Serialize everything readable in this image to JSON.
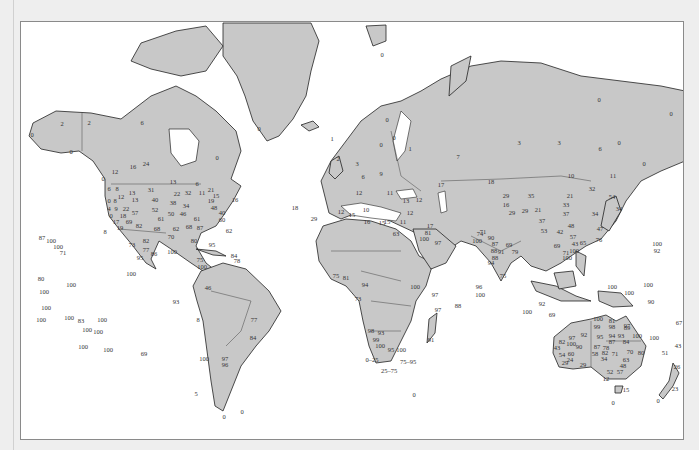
{
  "map": {
    "projection": "Mercator world map",
    "colors": {
      "land": "#c8c8c8",
      "ocean": "#ffffff",
      "outline": "#222222",
      "page": "#eeeeee"
    },
    "labels": [
      {
        "t": "2",
        "x": 61,
        "y": 123
      },
      {
        "t": "2",
        "x": 88,
        "y": 122
      },
      {
        "t": "0",
        "x": 31,
        "y": 134
      },
      {
        "t": "0",
        "x": 70,
        "y": 151
      },
      {
        "t": "6",
        "x": 141,
        "y": 122
      },
      {
        "t": "0",
        "x": 258,
        "y": 128
      },
      {
        "t": "0",
        "x": 216,
        "y": 157
      },
      {
        "t": "16",
        "x": 132,
        "y": 166
      },
      {
        "t": "24",
        "x": 145,
        "y": 163
      },
      {
        "t": "12",
        "x": 114,
        "y": 171
      },
      {
        "t": "0",
        "x": 102,
        "y": 178
      },
      {
        "t": "13",
        "x": 172,
        "y": 181
      },
      {
        "t": "6",
        "x": 196,
        "y": 183
      },
      {
        "t": "31",
        "x": 150,
        "y": 189
      },
      {
        "t": "6",
        "x": 108,
        "y": 188
      },
      {
        "t": "8",
        "x": 116,
        "y": 188
      },
      {
        "t": "12",
        "x": 120,
        "y": 196
      },
      {
        "t": "13",
        "x": 131,
        "y": 192
      },
      {
        "t": "22",
        "x": 176,
        "y": 193
      },
      {
        "t": "32",
        "x": 187,
        "y": 192
      },
      {
        "t": "11",
        "x": 201,
        "y": 192
      },
      {
        "t": "21",
        "x": 210,
        "y": 189
      },
      {
        "t": "0",
        "x": 108,
        "y": 200
      },
      {
        "t": "8",
        "x": 114,
        "y": 200
      },
      {
        "t": "13",
        "x": 134,
        "y": 199
      },
      {
        "t": "40",
        "x": 154,
        "y": 199
      },
      {
        "t": "38",
        "x": 172,
        "y": 202
      },
      {
        "t": "34",
        "x": 185,
        "y": 205
      },
      {
        "t": "19",
        "x": 210,
        "y": 200
      },
      {
        "t": "15",
        "x": 215,
        "y": 195
      },
      {
        "t": "16",
        "x": 234,
        "y": 199
      },
      {
        "t": "4",
        "x": 108,
        "y": 208
      },
      {
        "t": "9",
        "x": 115,
        "y": 208
      },
      {
        "t": "22",
        "x": 125,
        "y": 208
      },
      {
        "t": "52",
        "x": 154,
        "y": 209
      },
      {
        "t": "48",
        "x": 213,
        "y": 207
      },
      {
        "t": "40",
        "x": 221,
        "y": 212
      },
      {
        "t": "0",
        "x": 110,
        "y": 215
      },
      {
        "t": "18",
        "x": 122,
        "y": 215
      },
      {
        "t": "57",
        "x": 134,
        "y": 212
      },
      {
        "t": "50",
        "x": 170,
        "y": 213
      },
      {
        "t": "46",
        "x": 182,
        "y": 213
      },
      {
        "t": "60",
        "x": 221,
        "y": 219
      },
      {
        "t": "61",
        "x": 160,
        "y": 218
      },
      {
        "t": "61",
        "x": 196,
        "y": 218
      },
      {
        "t": "17",
        "x": 115,
        "y": 221
      },
      {
        "t": "69",
        "x": 128,
        "y": 221
      },
      {
        "t": "82",
        "x": 138,
        "y": 225
      },
      {
        "t": "62",
        "x": 175,
        "y": 228
      },
      {
        "t": "68",
        "x": 188,
        "y": 226
      },
      {
        "t": "87",
        "x": 199,
        "y": 227
      },
      {
        "t": "19",
        "x": 119,
        "y": 227
      },
      {
        "t": "8",
        "x": 104,
        "y": 231
      },
      {
        "t": "68",
        "x": 156,
        "y": 228
      },
      {
        "t": "70",
        "x": 170,
        "y": 236
      },
      {
        "t": "62",
        "x": 228,
        "y": 230
      },
      {
        "t": "80",
        "x": 193,
        "y": 240
      },
      {
        "t": "87",
        "x": 41,
        "y": 237
      },
      {
        "t": "100",
        "x": 50,
        "y": 240
      },
      {
        "t": "100",
        "x": 57,
        "y": 246
      },
      {
        "t": "71",
        "x": 62,
        "y": 252
      },
      {
        "t": "73",
        "x": 131,
        "y": 244
      },
      {
        "t": "82",
        "x": 145,
        "y": 240
      },
      {
        "t": "77",
        "x": 145,
        "y": 249
      },
      {
        "t": "86",
        "x": 153,
        "y": 253
      },
      {
        "t": "95",
        "x": 139,
        "y": 257
      },
      {
        "t": "100",
        "x": 171,
        "y": 251
      },
      {
        "t": "95",
        "x": 211,
        "y": 244
      },
      {
        "t": "84",
        "x": 233,
        "y": 255
      },
      {
        "t": "78",
        "x": 236,
        "y": 260
      },
      {
        "t": "75",
        "x": 199,
        "y": 259
      },
      {
        "t": "100",
        "x": 201,
        "y": 266
      },
      {
        "t": "100",
        "x": 130,
        "y": 273
      },
      {
        "t": "80",
        "x": 40,
        "y": 278
      },
      {
        "t": "100",
        "x": 70,
        "y": 284
      },
      {
        "t": "100",
        "x": 43,
        "y": 291
      },
      {
        "t": "46",
        "x": 207,
        "y": 287
      },
      {
        "t": "93",
        "x": 175,
        "y": 301
      },
      {
        "t": "100",
        "x": 45,
        "y": 307
      },
      {
        "t": "100",
        "x": 40,
        "y": 319
      },
      {
        "t": "100",
        "x": 68,
        "y": 317
      },
      {
        "t": "83",
        "x": 80,
        "y": 320
      },
      {
        "t": "100",
        "x": 101,
        "y": 319
      },
      {
        "t": "100",
        "x": 86,
        "y": 329
      },
      {
        "t": "100",
        "x": 97,
        "y": 331
      },
      {
        "t": "100",
        "x": 82,
        "y": 346
      },
      {
        "t": "100",
        "x": 107,
        "y": 349
      },
      {
        "t": "69",
        "x": 143,
        "y": 353
      },
      {
        "t": "8",
        "x": 197,
        "y": 319
      },
      {
        "t": "77",
        "x": 253,
        "y": 319
      },
      {
        "t": "84",
        "x": 252,
        "y": 337
      },
      {
        "t": "100",
        "x": 203,
        "y": 358
      },
      {
        "t": "97",
        "x": 224,
        "y": 358
      },
      {
        "t": "96",
        "x": 224,
        "y": 364
      },
      {
        "t": "5",
        "x": 195,
        "y": 393
      },
      {
        "t": "0",
        "x": 223,
        "y": 416
      },
      {
        "t": "0",
        "x": 241,
        "y": 411
      },
      {
        "t": "18",
        "x": 294,
        "y": 207
      },
      {
        "t": "29",
        "x": 313,
        "y": 218
      },
      {
        "t": "0",
        "x": 381,
        "y": 54
      },
      {
        "t": "0",
        "x": 386,
        "y": 119
      },
      {
        "t": "0",
        "x": 380,
        "y": 144
      },
      {
        "t": "0",
        "x": 393,
        "y": 137
      },
      {
        "t": "1",
        "x": 331,
        "y": 138
      },
      {
        "t": "2",
        "x": 337,
        "y": 158
      },
      {
        "t": "3",
        "x": 356,
        "y": 163
      },
      {
        "t": "6",
        "x": 362,
        "y": 176
      },
      {
        "t": "9",
        "x": 380,
        "y": 173
      },
      {
        "t": "1",
        "x": 409,
        "y": 148
      },
      {
        "t": "7",
        "x": 457,
        "y": 156
      },
      {
        "t": "3",
        "x": 518,
        "y": 142
      },
      {
        "t": "3",
        "x": 558,
        "y": 142
      },
      {
        "t": "6",
        "x": 599,
        "y": 148
      },
      {
        "t": "0",
        "x": 618,
        "y": 142
      },
      {
        "t": "0",
        "x": 598,
        "y": 99
      },
      {
        "t": "0",
        "x": 670,
        "y": 113
      },
      {
        "t": "0",
        "x": 643,
        "y": 163
      },
      {
        "t": "12",
        "x": 358,
        "y": 192
      },
      {
        "t": "11",
        "x": 389,
        "y": 192
      },
      {
        "t": "13",
        "x": 405,
        "y": 200
      },
      {
        "t": "17",
        "x": 440,
        "y": 184
      },
      {
        "t": "18",
        "x": 490,
        "y": 181
      },
      {
        "t": "10",
        "x": 570,
        "y": 175
      },
      {
        "t": "11",
        "x": 612,
        "y": 175
      },
      {
        "t": "12",
        "x": 340,
        "y": 211
      },
      {
        "t": "15",
        "x": 351,
        "y": 214
      },
      {
        "t": "10",
        "x": 365,
        "y": 209
      },
      {
        "t": "12",
        "x": 409,
        "y": 212
      },
      {
        "t": "12",
        "x": 418,
        "y": 199
      },
      {
        "t": "16",
        "x": 366,
        "y": 221
      },
      {
        "t": "15",
        "x": 386,
        "y": 221
      },
      {
        "t": "15",
        "x": 381,
        "y": 222
      },
      {
        "t": "11",
        "x": 402,
        "y": 221
      },
      {
        "t": "17",
        "x": 429,
        "y": 225
      },
      {
        "t": "63",
        "x": 395,
        "y": 233
      },
      {
        "t": "81",
        "x": 427,
        "y": 232
      },
      {
        "t": "100",
        "x": 423,
        "y": 238
      },
      {
        "t": "97",
        "x": 437,
        "y": 242
      },
      {
        "t": "29",
        "x": 505,
        "y": 195
      },
      {
        "t": "35",
        "x": 530,
        "y": 195
      },
      {
        "t": "21",
        "x": 569,
        "y": 195
      },
      {
        "t": "32",
        "x": 591,
        "y": 188
      },
      {
        "t": "16",
        "x": 505,
        "y": 204
      },
      {
        "t": "29",
        "x": 511,
        "y": 212
      },
      {
        "t": "29",
        "x": 524,
        "y": 210
      },
      {
        "t": "21",
        "x": 537,
        "y": 209
      },
      {
        "t": "33",
        "x": 565,
        "y": 204
      },
      {
        "t": "37",
        "x": 565,
        "y": 213
      },
      {
        "t": "34",
        "x": 594,
        "y": 213
      },
      {
        "t": "34",
        "x": 618,
        "y": 208
      },
      {
        "t": "54",
        "x": 611,
        "y": 196
      },
      {
        "t": "37",
        "x": 541,
        "y": 220
      },
      {
        "t": "53",
        "x": 543,
        "y": 230
      },
      {
        "t": "42",
        "x": 559,
        "y": 231
      },
      {
        "t": "48",
        "x": 570,
        "y": 225
      },
      {
        "t": "47",
        "x": 599,
        "y": 228
      },
      {
        "t": "76",
        "x": 598,
        "y": 239
      },
      {
        "t": "65",
        "x": 582,
        "y": 242
      },
      {
        "t": "57",
        "x": 572,
        "y": 236
      },
      {
        "t": "43",
        "x": 574,
        "y": 243
      },
      {
        "t": "69",
        "x": 556,
        "y": 245
      },
      {
        "t": "71",
        "x": 482,
        "y": 231
      },
      {
        "t": "74",
        "x": 479,
        "y": 233
      },
      {
        "t": "100",
        "x": 476,
        "y": 240
      },
      {
        "t": "90",
        "x": 490,
        "y": 237
      },
      {
        "t": "87",
        "x": 494,
        "y": 243
      },
      {
        "t": "69",
        "x": 508,
        "y": 244
      },
      {
        "t": "88",
        "x": 493,
        "y": 250
      },
      {
        "t": "91",
        "x": 500,
        "y": 251
      },
      {
        "t": "88",
        "x": 494,
        "y": 257
      },
      {
        "t": "79",
        "x": 514,
        "y": 251
      },
      {
        "t": "94",
        "x": 490,
        "y": 262
      },
      {
        "t": "71",
        "x": 565,
        "y": 252
      },
      {
        "t": "100",
        "x": 573,
        "y": 250
      },
      {
        "t": "100",
        "x": 566,
        "y": 257
      },
      {
        "t": "75",
        "x": 502,
        "y": 275
      },
      {
        "t": "100",
        "x": 656,
        "y": 243
      },
      {
        "t": "92",
        "x": 656,
        "y": 250
      },
      {
        "t": "100",
        "x": 647,
        "y": 284
      },
      {
        "t": "100",
        "x": 611,
        "y": 286
      },
      {
        "t": "90",
        "x": 650,
        "y": 301
      },
      {
        "t": "100",
        "x": 628,
        "y": 292
      },
      {
        "t": "67",
        "x": 678,
        "y": 322
      },
      {
        "t": "100",
        "x": 653,
        "y": 337
      },
      {
        "t": "100",
        "x": 597,
        "y": 318
      },
      {
        "t": "92",
        "x": 541,
        "y": 303
      },
      {
        "t": "100",
        "x": 526,
        "y": 311
      },
      {
        "t": "69",
        "x": 551,
        "y": 314
      },
      {
        "t": "96",
        "x": 478,
        "y": 286
      },
      {
        "t": "100",
        "x": 479,
        "y": 294
      },
      {
        "t": "88",
        "x": 457,
        "y": 305
      },
      {
        "t": "97",
        "x": 437,
        "y": 309
      },
      {
        "t": "91",
        "x": 430,
        "y": 339
      },
      {
        "t": "75",
        "x": 335,
        "y": 275
      },
      {
        "t": "81",
        "x": 345,
        "y": 277
      },
      {
        "t": "73",
        "x": 357,
        "y": 298
      },
      {
        "t": "94",
        "x": 364,
        "y": 284
      },
      {
        "t": "100",
        "x": 414,
        "y": 286
      },
      {
        "t": "97",
        "x": 434,
        "y": 294
      },
      {
        "t": "98",
        "x": 370,
        "y": 330
      },
      {
        "t": "93",
        "x": 380,
        "y": 332
      },
      {
        "t": "99",
        "x": 375,
        "y": 339
      },
      {
        "t": "100",
        "x": 379,
        "y": 345
      },
      {
        "t": "95",
        "x": 390,
        "y": 349
      },
      {
        "t": "100",
        "x": 400,
        "y": 349
      },
      {
        "t": "0–25",
        "x": 371,
        "y": 359
      },
      {
        "t": "75–95",
        "x": 407,
        "y": 361
      },
      {
        "t": "25–75",
        "x": 388,
        "y": 370
      },
      {
        "t": "0",
        "x": 413,
        "y": 394
      },
      {
        "t": "81",
        "x": 611,
        "y": 320
      },
      {
        "t": "99",
        "x": 596,
        "y": 326
      },
      {
        "t": "98",
        "x": 611,
        "y": 326
      },
      {
        "t": "89",
        "x": 626,
        "y": 327
      },
      {
        "t": "97",
        "x": 626,
        "y": 325
      },
      {
        "t": "92",
        "x": 583,
        "y": 334
      },
      {
        "t": "97",
        "x": 571,
        "y": 337
      },
      {
        "t": "100",
        "x": 570,
        "y": 343
      },
      {
        "t": "95",
        "x": 599,
        "y": 336
      },
      {
        "t": "94",
        "x": 611,
        "y": 335
      },
      {
        "t": "93",
        "x": 620,
        "y": 335
      },
      {
        "t": "100",
        "x": 636,
        "y": 335
      },
      {
        "t": "82",
        "x": 561,
        "y": 341
      },
      {
        "t": "43",
        "x": 556,
        "y": 347
      },
      {
        "t": "90",
        "x": 578,
        "y": 346
      },
      {
        "t": "87",
        "x": 596,
        "y": 346
      },
      {
        "t": "78",
        "x": 605,
        "y": 347
      },
      {
        "t": "87",
        "x": 611,
        "y": 341
      },
      {
        "t": "84",
        "x": 625,
        "y": 341
      },
      {
        "t": "80",
        "x": 640,
        "y": 352
      },
      {
        "t": "54",
        "x": 561,
        "y": 354
      },
      {
        "t": "60",
        "x": 570,
        "y": 353
      },
      {
        "t": "58",
        "x": 594,
        "y": 353
      },
      {
        "t": "82",
        "x": 604,
        "y": 352
      },
      {
        "t": "71",
        "x": 614,
        "y": 353
      },
      {
        "t": "70",
        "x": 629,
        "y": 351
      },
      {
        "t": "24",
        "x": 569,
        "y": 359
      },
      {
        "t": "34",
        "x": 603,
        "y": 358
      },
      {
        "t": "63",
        "x": 625,
        "y": 359
      },
      {
        "t": "29",
        "x": 564,
        "y": 362
      },
      {
        "t": "29",
        "x": 582,
        "y": 364
      },
      {
        "t": "48",
        "x": 622,
        "y": 365
      },
      {
        "t": "52",
        "x": 609,
        "y": 371
      },
      {
        "t": "57",
        "x": 619,
        "y": 371
      },
      {
        "t": "12",
        "x": 605,
        "y": 378
      },
      {
        "t": "15",
        "x": 625,
        "y": 389
      },
      {
        "t": "51",
        "x": 664,
        "y": 352
      },
      {
        "t": "43",
        "x": 677,
        "y": 345
      },
      {
        "t": "26",
        "x": 676,
        "y": 366
      },
      {
        "t": "23",
        "x": 674,
        "y": 388
      },
      {
        "t": "0",
        "x": 657,
        "y": 400
      },
      {
        "t": "0",
        "x": 612,
        "y": 402
      }
    ]
  }
}
